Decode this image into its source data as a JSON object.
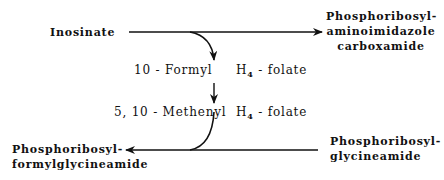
{
  "diagram": {
    "type": "metabolic-pathway",
    "nodes": {
      "inosinate": "Inosinate",
      "aicar_line1": "Phosphoribosyl-",
      "aicar_line2": "aminoimidazole",
      "aicar_line3": "carboxamide",
      "fgar_line1": "Phosphoribosyl-",
      "fgar_line2": "formylglycineamide",
      "gar_line1": "Phosphoribosyl-",
      "gar_line2": "glycineamide"
    },
    "cofactors": {
      "formyl_prefix": "10 - Formyl",
      "formyl_h": "H",
      "formyl_sub": "4",
      "formyl_suffix": " - folate",
      "methenyl_prefix": "5, 10 - Methenyl",
      "methenyl_h": "H",
      "methenyl_sub": "4",
      "methenyl_suffix": " - folate"
    },
    "edges": [
      {
        "from": "Inosinate",
        "to": "Phosphoribosyl-aminoimidazole carboxamide",
        "direction": "right"
      },
      {
        "from": "Phosphoribosyl-glycineamide",
        "to": "Phosphoribosyl-formylglycineamide",
        "direction": "left"
      },
      {
        "from": "10-Formyl H4-folate",
        "to": "5,10-Methenyl H4-folate",
        "direction": "down"
      }
    ],
    "colors": {
      "ink": "#111111",
      "background": "#ffffff"
    }
  }
}
